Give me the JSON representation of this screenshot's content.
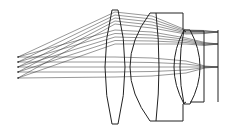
{
  "diagram": {
    "type": "optical-ray-trace",
    "stroke_color": "#222222",
    "background": "#ffffff",
    "elements": [
      {
        "name": "biconvex-lens-1",
        "kind": "biconvex"
      },
      {
        "name": "meniscus-block-lens-2",
        "kind": "meniscus-with-flat-block"
      },
      {
        "name": "biconvex-lens-3",
        "kind": "biconvex"
      },
      {
        "name": "flat-plate-4",
        "kind": "plate"
      },
      {
        "name": "image-plane",
        "kind": "plane"
      }
    ],
    "ray_bundles": [
      {
        "name": "off-axis-upper",
        "start_y": [
          57,
          62,
          67,
          72,
          78
        ],
        "focus_y": 32
      },
      {
        "name": "off-axis-mid",
        "start_y": [
          57,
          62,
          67,
          72,
          78
        ],
        "focus_y": 44
      },
      {
        "name": "on-axis",
        "start_y": [
          57,
          62,
          67,
          72,
          78
        ],
        "focus_y": 67
      }
    ]
  }
}
